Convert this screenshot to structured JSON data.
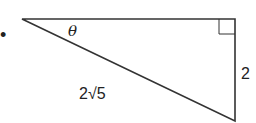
{
  "diagram": {
    "type": "right-triangle",
    "bullet": "•",
    "angle_label": "θ",
    "hypotenuse_label": "2√5",
    "vertical_side_label": "2",
    "right_angle_marker": true,
    "stroke_color": "#333333"
  }
}
